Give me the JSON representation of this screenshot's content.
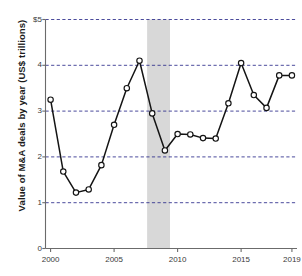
{
  "chart_data": {
    "type": "line",
    "title": "",
    "xlabel": "",
    "ylabel": "Value of M&A deals by year (US$ trillions)",
    "x": [
      2000,
      2001,
      2002,
      2003,
      2004,
      2005,
      2006,
      2007,
      2008,
      2009,
      2010,
      2011,
      2012,
      2013,
      2014,
      2015,
      2016,
      2017,
      2018,
      2019
    ],
    "values": [
      3.25,
      1.68,
      1.22,
      1.29,
      1.82,
      2.7,
      3.5,
      4.1,
      2.95,
      2.14,
      2.5,
      2.49,
      2.41,
      2.4,
      3.17,
      4.05,
      3.35,
      3.07,
      3.78,
      3.78
    ],
    "series": [
      {
        "name": "Value of M&A deals by year",
        "values": [
          3.25,
          1.68,
          1.22,
          1.29,
          1.82,
          2.7,
          3.5,
          4.1,
          2.95,
          2.14,
          2.5,
          2.49,
          2.41,
          2.4,
          3.17,
          4.05,
          3.35,
          3.07,
          3.78,
          3.78
        ]
      }
    ],
    "xlim": [
      1999.6,
      2019.4
    ],
    "ylim": [
      0,
      5
    ],
    "y_ticks": [
      0,
      1,
      2,
      3,
      4,
      5
    ],
    "y_tick_labels": [
      "0",
      "1",
      "2",
      "3",
      "4",
      "$5"
    ],
    "x_ticks": [
      2000,
      2005,
      2010,
      2015,
      2019
    ],
    "x_tick_labels": [
      "2000",
      "2005",
      "2010",
      "2015",
      "2019"
    ],
    "grid": true,
    "grid_style": "dashed",
    "legend": "none",
    "marker": "open-circle",
    "annotations": [
      {
        "type": "shaded-band",
        "label": "recession",
        "x_start": 2007.6,
        "x_end": 2009.4,
        "color": "#d8d8d8"
      }
    ],
    "colors": {
      "line": "#141414",
      "marker_fill": "#ffffff",
      "marker_stroke": "#141414",
      "grid": "#2b2b8a",
      "axis": "#6b6b6b",
      "band": "#d8d8d8",
      "text": "#231f20"
    }
  }
}
